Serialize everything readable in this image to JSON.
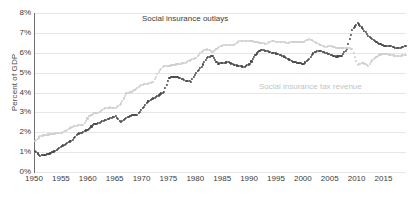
{
  "chart_data": {
    "type": "line",
    "title": "",
    "xlabel": "",
    "ylabel": "Percent of GDP",
    "xlim": [
      1950,
      2019
    ],
    "ylim": [
      0,
      8
    ],
    "grid": true,
    "legend_position": "inline-annotation",
    "y_tick_labels": [
      "0%",
      "1%",
      "2%",
      "3%",
      "4%",
      "5%",
      "6%",
      "7%",
      "8%"
    ],
    "y_tick_values": [
      0,
      1,
      2,
      3,
      4,
      5,
      6,
      7,
      8
    ],
    "x_tick_labels": [
      "1950",
      "1955",
      "1960",
      "1965",
      "1970",
      "1975",
      "1980",
      "1985",
      "1990",
      "1995",
      "2000",
      "2005",
      "2010",
      "2015"
    ],
    "x_tick_values": [
      1950,
      1955,
      1960,
      1965,
      1970,
      1975,
      1980,
      1985,
      1990,
      1995,
      2000,
      2005,
      2010,
      2015
    ],
    "x": [
      1950,
      1951,
      1952,
      1953,
      1954,
      1955,
      1956,
      1957,
      1958,
      1959,
      1960,
      1961,
      1962,
      1963,
      1964,
      1965,
      1966,
      1967,
      1968,
      1969,
      1970,
      1971,
      1972,
      1973,
      1974,
      1975,
      1976,
      1977,
      1978,
      1979,
      1980,
      1981,
      1982,
      1983,
      1984,
      1985,
      1986,
      1987,
      1988,
      1989,
      1990,
      1991,
      1992,
      1993,
      1994,
      1995,
      1996,
      1997,
      1998,
      1999,
      2000,
      2001,
      2002,
      2003,
      2004,
      2005,
      2006,
      2007,
      2008,
      2009,
      2010,
      2011,
      2012,
      2013,
      2014,
      2015,
      2016,
      2017,
      2018,
      2019
    ],
    "series": [
      {
        "name": "Social insurance outlays",
        "color": "#4a4a4a",
        "style": "dotted",
        "values": [
          1.05,
          0.82,
          0.88,
          0.95,
          1.12,
          1.3,
          1.45,
          1.62,
          1.92,
          2.0,
          2.18,
          2.4,
          2.48,
          2.62,
          2.7,
          2.8,
          2.52,
          2.72,
          2.85,
          2.88,
          3.2,
          3.55,
          3.7,
          3.85,
          4.05,
          4.75,
          4.8,
          4.72,
          4.6,
          4.55,
          5.0,
          5.3,
          5.75,
          5.85,
          5.45,
          5.5,
          5.52,
          5.4,
          5.32,
          5.3,
          5.45,
          5.9,
          6.15,
          6.1,
          6.0,
          5.95,
          5.85,
          5.7,
          5.55,
          5.48,
          5.45,
          5.7,
          6.05,
          6.1,
          6.0,
          5.9,
          5.8,
          5.85,
          6.2,
          7.15,
          7.5,
          7.2,
          6.85,
          6.65,
          6.45,
          6.35,
          6.35,
          6.25,
          6.25,
          6.35
        ]
      },
      {
        "name": "Social insurance tax revenue",
        "color": "#cfcfcf",
        "style": "dotted",
        "values": [
          1.55,
          1.8,
          1.88,
          1.9,
          1.95,
          1.98,
          2.12,
          2.28,
          2.35,
          2.38,
          2.8,
          2.95,
          3.0,
          3.2,
          3.25,
          3.2,
          3.45,
          3.95,
          4.05,
          4.25,
          4.4,
          4.45,
          4.55,
          5.05,
          5.35,
          5.35,
          5.4,
          5.45,
          5.5,
          5.65,
          5.75,
          6.05,
          6.2,
          6.05,
          6.25,
          6.4,
          6.4,
          6.4,
          6.6,
          6.6,
          6.6,
          6.55,
          6.5,
          6.45,
          6.6,
          6.55,
          6.55,
          6.5,
          6.55,
          6.55,
          6.55,
          6.7,
          6.55,
          6.4,
          6.3,
          6.35,
          6.25,
          6.25,
          6.25,
          6.2,
          5.4,
          5.5,
          5.35,
          5.7,
          5.9,
          5.95,
          5.9,
          5.85,
          5.85,
          5.9
        ]
      }
    ],
    "annotations": [
      {
        "text": "Social insurance outlays",
        "color": "#3d3d3d"
      },
      {
        "text": "Social insurance tax revenue",
        "color": "#c3c3c3"
      }
    ]
  }
}
